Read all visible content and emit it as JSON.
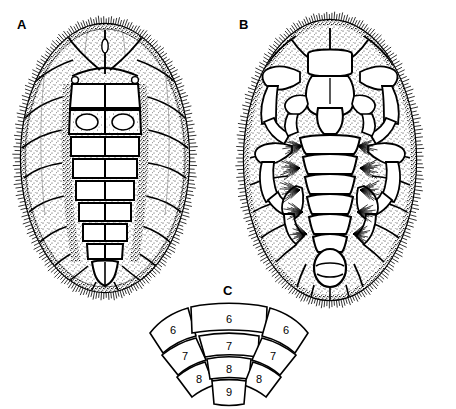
{
  "figure": {
    "background_color": "#ffffff",
    "ink_color": "#000000",
    "panels": [
      {
        "id": "A",
        "label": "A",
        "view": "dorsal",
        "description": "Dorsal habitus of oval mite larva with segmented median plates and marginal fringe of setae"
      },
      {
        "id": "B",
        "label": "B",
        "view": "ventral",
        "description": "Ventral habitus showing gnathosoma, four pairs of legs, setose abdominal segments and terminal anal opening"
      },
      {
        "id": "C",
        "label": "C",
        "view": "segment-diagram",
        "description": "Fan-shaped diagram of numbered cuticular segments"
      }
    ]
  },
  "panel_c": {
    "label": "C",
    "shape": "fan",
    "rows": [
      {
        "row": 1,
        "cells": [
          {
            "value": "6",
            "position": "left-outer"
          },
          {
            "value": "6",
            "position": "center"
          },
          {
            "value": "6",
            "position": "right-outer"
          }
        ]
      },
      {
        "row": 2,
        "cells": [
          {
            "value": "7",
            "position": "left"
          },
          {
            "value": "7",
            "position": "center"
          },
          {
            "value": "7",
            "position": "right"
          }
        ]
      },
      {
        "row": 3,
        "cells": [
          {
            "value": "8",
            "position": "left"
          },
          {
            "value": "8",
            "position": "center"
          },
          {
            "value": "8",
            "position": "right"
          }
        ]
      },
      {
        "row": 4,
        "cells": [
          {
            "value": "9",
            "position": "center"
          }
        ]
      }
    ],
    "all_values": [
      "6",
      "6",
      "6",
      "7",
      "7",
      "7",
      "8",
      "8",
      "8",
      "9"
    ]
  }
}
